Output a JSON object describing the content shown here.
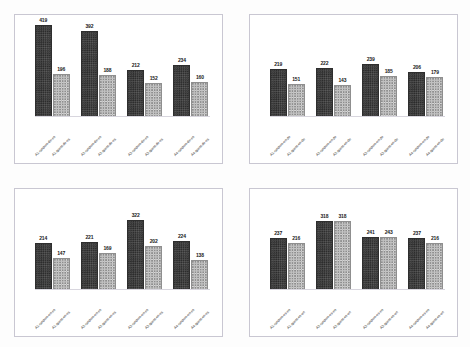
{
  "figure": {
    "title": "",
    "background_color": "#fdfdfd",
    "panel_border_color": "#c9c7d2",
    "series_colors": {
      "random": "#474747",
      "quest": "#d6d6d6"
    }
  },
  "chart_data": [
    {
      "type": "bar",
      "panel": "top-left",
      "title": "",
      "xlabel": "",
      "ylabel": "",
      "grid": false,
      "legend": "none",
      "ylim": [
        0,
        440
      ],
      "categories": [
        "A1-random-de-es",
        "A1-quest-de-es",
        "A2-random-de-es",
        "A2-quest-de-es",
        "A3-random-de-es",
        "A3-quest-de-es",
        "A4-random-de-es",
        "A4-quest-de-es"
      ],
      "values": [
        419,
        196,
        392,
        188,
        212,
        152,
        234,
        160
      ]
    },
    {
      "type": "bar",
      "panel": "top-right",
      "title": "",
      "xlabel": "",
      "ylabel": "",
      "grid": false,
      "legend": "none",
      "ylim": [
        0,
        440
      ],
      "categories": [
        "A1-random-en-de",
        "A1-quest-en-de",
        "A2-random-en-de",
        "A2-quest-en-de",
        "A3-random-en-de",
        "A3-quest-en-de",
        "A4-random-en-de",
        "A4-quest-en-de"
      ],
      "values": [
        219,
        151,
        222,
        143,
        239,
        185,
        206,
        179
      ]
    },
    {
      "type": "bar",
      "panel": "bottom-left",
      "title": "",
      "xlabel": "",
      "ylabel": "",
      "grid": false,
      "legend": "none",
      "ylim": [
        0,
        440
      ],
      "categories": [
        "A1-random-en-es",
        "A1-quest-en-es",
        "A2-random-en-es",
        "A2-quest-en-es",
        "A3-random-en-es",
        "A3-quest-en-es",
        "A4-random-en-es",
        "A4-quest-en-es"
      ],
      "values": [
        214,
        147,
        221,
        169,
        322,
        202,
        224,
        138
      ]
    },
    {
      "type": "bar",
      "panel": "bottom-right",
      "title": "",
      "xlabel": "",
      "ylabel": "",
      "grid": false,
      "legend": "none",
      "ylim": [
        0,
        440
      ],
      "categories": [
        "A1-random-es-en",
        "A1-quest-es-en",
        "A2-random-es-en",
        "A2-quest-es-en",
        "A3-random-es-en",
        "A3-quest-es-en",
        "A4-random-es-en",
        "A4-quest-es-en"
      ],
      "values": [
        237,
        216,
        318,
        318,
        241,
        243,
        237,
        216
      ]
    }
  ]
}
